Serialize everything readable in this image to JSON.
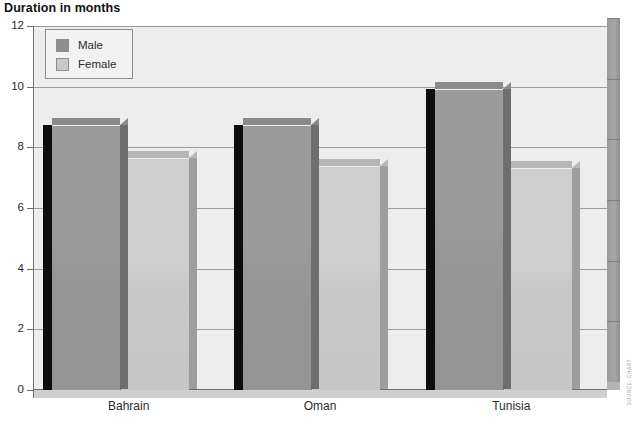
{
  "chart_data": {
    "type": "bar",
    "title": "Duration in months",
    "xlabel": "",
    "ylabel": "",
    "ylim": [
      0,
      12
    ],
    "ytick_step": 2,
    "yticks": [
      0,
      2,
      4,
      6,
      8,
      10,
      12
    ],
    "grid": true,
    "legend_position": "top-left",
    "categories": [
      "Bahrain",
      "Oman",
      "Tunisia"
    ],
    "series": [
      {
        "name": "Male",
        "color": "#969696",
        "values": [
          8.7,
          8.7,
          9.9
        ]
      },
      {
        "name": "Female",
        "color": "#c9c9c9",
        "values": [
          7.6,
          7.35,
          7.3
        ]
      }
    ]
  },
  "legend": {
    "items": [
      {
        "label": "Male"
      },
      {
        "label": "Female"
      }
    ]
  },
  "credit": {
    "vertical_text": "SOURCE: CHART",
    "footnote": ""
  }
}
